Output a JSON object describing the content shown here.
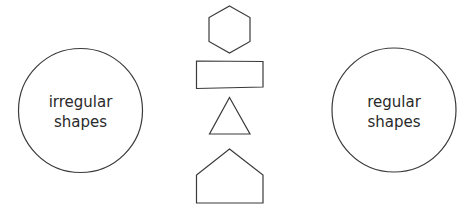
{
  "diagram": {
    "left_set": {
      "line1": "irregular",
      "line2": "shapes"
    },
    "right_set": {
      "line1": "regular",
      "line2": "shapes"
    },
    "shapes": [
      "hexagon",
      "rectangle",
      "triangle",
      "pentagon"
    ],
    "colors": {
      "stroke": "#3a3a3a",
      "text": "#2a2a2a",
      "background": "#ffffff"
    }
  }
}
